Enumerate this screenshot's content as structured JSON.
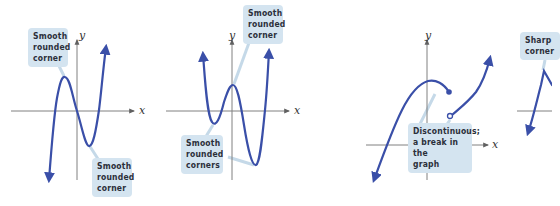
{
  "diagram": {
    "colors": {
      "curve": "#3a4fa8",
      "axis": "#808080",
      "callout_bg": "#d4e4f0",
      "callout_text": "#2b2f3a",
      "leader": "#c5d9e8"
    },
    "panels": [
      {
        "id": "panel-1",
        "description": "Cubic polynomial, continuous and smooth",
        "axis_labels": {
          "x": "x",
          "y": "y"
        },
        "callouts": [
          {
            "text": "Smooth\nrounded\ncorner",
            "points_to": "local maximum"
          },
          {
            "text": "Smooth\nrounded\ncorner",
            "points_to": "local minimum"
          }
        ]
      },
      {
        "id": "panel-2",
        "description": "Quartic polynomial, continuous and smooth",
        "axis_labels": {
          "x": "x",
          "y": "y"
        },
        "callouts": [
          {
            "text": "Smooth\nrounded\ncorner",
            "points_to": "local maximum"
          },
          {
            "text": "Smooth\nrounded\ncorners",
            "points_to": "two local minima"
          }
        ]
      },
      {
        "id": "panel-3",
        "description": "Discontinuous function with a jump",
        "axis_labels": {
          "x": "x",
          "y": "y"
        },
        "callouts": [
          {
            "text": "Discontinuous;\na break in the\ngraph",
            "points_to": "jump between closed and open endpoints"
          }
        ]
      },
      {
        "id": "panel-4",
        "description": "Function with a sharp corner (partially cropped)",
        "axis_labels": {},
        "callouts": [
          {
            "text": "Sharp\ncorner",
            "points_to": "cusp / corner point"
          }
        ]
      }
    ]
  }
}
